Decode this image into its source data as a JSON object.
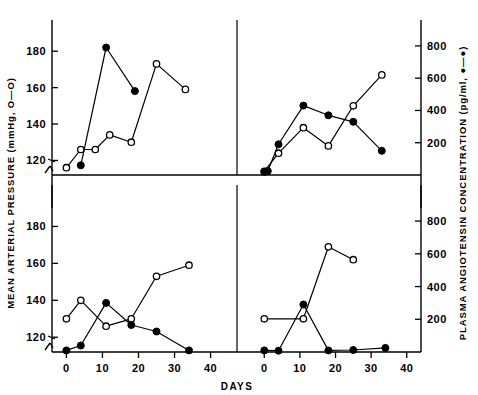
{
  "figure": {
    "type": "multi-panel-line-chart",
    "panel_count": 4,
    "layout": "2x2"
  },
  "axes": {
    "left_label": "MEAN ARTERIAL PRESSURE (mmHg, O—O)",
    "right_label": "PLASMA ANGIOTENSIN CONCENTRATION (pg/ml, ●—●)",
    "x_label": "DAYS",
    "left_ticks": [
      "120",
      "140",
      "160",
      "180"
    ],
    "right_ticks": [
      "200",
      "400",
      "600",
      "800"
    ],
    "x_ticks": [
      "0",
      "10",
      "20",
      "30",
      "40"
    ],
    "left_axis_break": true
  },
  "legend": {
    "open_circle_series": "Mean arterial pressure (mmHg)",
    "filled_circle_series": "Plasma angiotensin concentration (pg/ml)"
  },
  "chart_data": [
    {
      "type": "line",
      "panel": "top-left",
      "title": "",
      "xlabel": "DAYS",
      "ylabel": "MEAN ARTERIAL PRESSURE (mmHg)",
      "y2label": "PLASMA ANGIOTENSIN CONCENTRATION (pg/ml)",
      "xlim": [
        -4,
        44
      ],
      "ylim": [
        112,
        190
      ],
      "y2lim": [
        0,
        880
      ],
      "grid": false,
      "series": [
        {
          "name": "Mean arterial pressure (mmHg)",
          "marker": "open-circle",
          "axis": "left",
          "x": [
            0,
            4,
            8,
            12,
            18,
            25,
            33
          ],
          "values": [
            116,
            126,
            126,
            134,
            130,
            173,
            159
          ]
        },
        {
          "name": "Plasma angiotensin concentration (pg/ml)",
          "marker": "filled-circle",
          "axis": "right",
          "x": [
            4,
            11,
            19
          ],
          "values": [
            60,
            790,
            520
          ]
        }
      ]
    },
    {
      "type": "line",
      "panel": "top-right",
      "title": "",
      "xlabel": "DAYS",
      "ylabel": "MEAN ARTERIAL PRESSURE (mmHg)",
      "y2label": "PLASMA ANGIOTENSIN CONCENTRATION (pg/ml)",
      "xlim": [
        -4,
        44
      ],
      "ylim": [
        112,
        190
      ],
      "y2lim": [
        0,
        880
      ],
      "grid": false,
      "series": [
        {
          "name": "Mean arterial pressure (mmHg)",
          "marker": "open-circle",
          "axis": "left",
          "x": [
            0,
            4,
            11,
            18,
            25,
            33
          ],
          "values": [
            114,
            124,
            138,
            128,
            150,
            167
          ]
        },
        {
          "name": "Plasma angiotensin concentration (pg/ml)",
          "marker": "filled-circle",
          "axis": "right",
          "x": [
            0,
            1,
            4,
            11,
            18,
            25,
            33
          ],
          "values": [
            20,
            25,
            190,
            430,
            370,
            330,
            150
          ]
        }
      ]
    },
    {
      "type": "line",
      "panel": "bottom-left",
      "title": "",
      "xlabel": "DAYS",
      "ylabel": "MEAN ARTERIAL PRESSURE (mmHg)",
      "y2label": "PLASMA ANGIOTENSIN CONCENTRATION (pg/ml)",
      "xlim": [
        -4,
        44
      ],
      "ylim": [
        112,
        190
      ],
      "y2lim": [
        0,
        880
      ],
      "grid": false,
      "series": [
        {
          "name": "Mean arterial pressure (mmHg)",
          "marker": "open-circle",
          "axis": "left",
          "x": [
            0,
            4,
            11,
            18,
            25,
            34
          ],
          "values": [
            130,
            140,
            126,
            130,
            153,
            159
          ]
        },
        {
          "name": "Plasma angiotensin concentration (pg/ml)",
          "marker": "filled-circle",
          "axis": "right",
          "x": [
            0,
            4,
            11,
            18,
            25,
            34
          ],
          "values": [
            10,
            40,
            300,
            165,
            125,
            10
          ]
        }
      ]
    },
    {
      "type": "line",
      "panel": "bottom-right",
      "title": "",
      "xlabel": "DAYS",
      "ylabel": "MEAN ARTERIAL PRESSURE (mmHg)",
      "y2label": "PLASMA ANGIOTENSIN CONCENTRATION (pg/ml)",
      "xlim": [
        -4,
        44
      ],
      "ylim": [
        112,
        190
      ],
      "y2lim": [
        0,
        880
      ],
      "grid": false,
      "series": [
        {
          "name": "Mean arterial pressure (mmHg)",
          "marker": "open-circle",
          "axis": "left",
          "x": [
            0,
            11,
            18,
            25
          ],
          "values": [
            130,
            130,
            169,
            162
          ]
        },
        {
          "name": "Plasma angiotensin concentration (pg/ml)",
          "marker": "filled-circle",
          "axis": "right",
          "x": [
            0,
            4,
            11,
            18,
            25,
            34
          ],
          "values": [
            10,
            8,
            290,
            10,
            12,
            25
          ]
        }
      ]
    }
  ]
}
